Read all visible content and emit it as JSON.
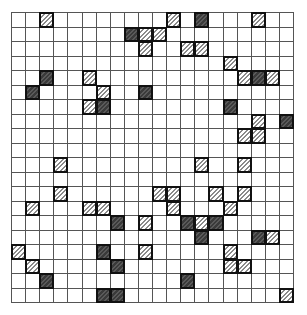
{
  "grid": {
    "rows": 20,
    "cols": 20,
    "colors": {
      "light_fill": "#ffffff",
      "light_hatch": "#8a8a8a",
      "dark_fill": "#3a3a3a",
      "dark_hatch": "#5a5a5a",
      "border": "#111111",
      "gridline": "#555555"
    },
    "cells": [
      {
        "r": 0,
        "c": 2,
        "t": "light"
      },
      {
        "r": 0,
        "c": 11,
        "t": "light"
      },
      {
        "r": 0,
        "c": 13,
        "t": "dark"
      },
      {
        "r": 0,
        "c": 17,
        "t": "light"
      },
      {
        "r": 1,
        "c": 8,
        "t": "dark"
      },
      {
        "r": 1,
        "c": 9,
        "t": "light"
      },
      {
        "r": 1,
        "c": 10,
        "t": "light"
      },
      {
        "r": 2,
        "c": 9,
        "t": "light"
      },
      {
        "r": 2,
        "c": 12,
        "t": "light"
      },
      {
        "r": 2,
        "c": 13,
        "t": "light"
      },
      {
        "r": 3,
        "c": 15,
        "t": "light"
      },
      {
        "r": 4,
        "c": 2,
        "t": "dark"
      },
      {
        "r": 4,
        "c": 5,
        "t": "light"
      },
      {
        "r": 4,
        "c": 16,
        "t": "light"
      },
      {
        "r": 4,
        "c": 17,
        "t": "dark"
      },
      {
        "r": 4,
        "c": 18,
        "t": "light"
      },
      {
        "r": 5,
        "c": 1,
        "t": "dark"
      },
      {
        "r": 5,
        "c": 6,
        "t": "light"
      },
      {
        "r": 5,
        "c": 9,
        "t": "dark"
      },
      {
        "r": 6,
        "c": 5,
        "t": "light"
      },
      {
        "r": 6,
        "c": 6,
        "t": "dark"
      },
      {
        "r": 6,
        "c": 15,
        "t": "dark"
      },
      {
        "r": 7,
        "c": 17,
        "t": "light"
      },
      {
        "r": 7,
        "c": 19,
        "t": "dark"
      },
      {
        "r": 8,
        "c": 16,
        "t": "light"
      },
      {
        "r": 8,
        "c": 17,
        "t": "light"
      },
      {
        "r": 10,
        "c": 3,
        "t": "light"
      },
      {
        "r": 10,
        "c": 13,
        "t": "light"
      },
      {
        "r": 10,
        "c": 16,
        "t": "light"
      },
      {
        "r": 12,
        "c": 3,
        "t": "light"
      },
      {
        "r": 12,
        "c": 10,
        "t": "light"
      },
      {
        "r": 12,
        "c": 11,
        "t": "light"
      },
      {
        "r": 12,
        "c": 14,
        "t": "light"
      },
      {
        "r": 12,
        "c": 16,
        "t": "light"
      },
      {
        "r": 13,
        "c": 1,
        "t": "light"
      },
      {
        "r": 13,
        "c": 5,
        "t": "light"
      },
      {
        "r": 13,
        "c": 6,
        "t": "light"
      },
      {
        "r": 13,
        "c": 11,
        "t": "light"
      },
      {
        "r": 13,
        "c": 15,
        "t": "light"
      },
      {
        "r": 14,
        "c": 7,
        "t": "dark"
      },
      {
        "r": 14,
        "c": 9,
        "t": "light"
      },
      {
        "r": 14,
        "c": 12,
        "t": "dark"
      },
      {
        "r": 14,
        "c": 13,
        "t": "light"
      },
      {
        "r": 14,
        "c": 14,
        "t": "dark"
      },
      {
        "r": 15,
        "c": 13,
        "t": "dark"
      },
      {
        "r": 15,
        "c": 17,
        "t": "dark"
      },
      {
        "r": 15,
        "c": 18,
        "t": "light"
      },
      {
        "r": 16,
        "c": 0,
        "t": "light"
      },
      {
        "r": 16,
        "c": 6,
        "t": "dark"
      },
      {
        "r": 16,
        "c": 9,
        "t": "light"
      },
      {
        "r": 16,
        "c": 15,
        "t": "light"
      },
      {
        "r": 17,
        "c": 1,
        "t": "light"
      },
      {
        "r": 17,
        "c": 7,
        "t": "dark"
      },
      {
        "r": 17,
        "c": 15,
        "t": "light"
      },
      {
        "r": 17,
        "c": 16,
        "t": "light"
      },
      {
        "r": 18,
        "c": 2,
        "t": "dark"
      },
      {
        "r": 18,
        "c": 12,
        "t": "dark"
      },
      {
        "r": 19,
        "c": 6,
        "t": "dark"
      },
      {
        "r": 19,
        "c": 7,
        "t": "dark"
      },
      {
        "r": 19,
        "c": 19,
        "t": "light"
      }
    ]
  }
}
